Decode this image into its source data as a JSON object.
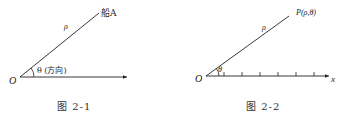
{
  "figures": [
    {
      "id": "fig-2-1",
      "caption": "图 2-1",
      "origin_label": "O",
      "ray_label": "ρ",
      "point_label": "船A",
      "angle_label": "θ (方向)"
    },
    {
      "id": "fig-2-2",
      "caption": "图 2-2",
      "origin_label": "O",
      "ray_label": "ρ",
      "point_label": "P(ρ,θ)",
      "angle_label": "θ",
      "axis_label": "x",
      "tick_count": 6
    }
  ]
}
